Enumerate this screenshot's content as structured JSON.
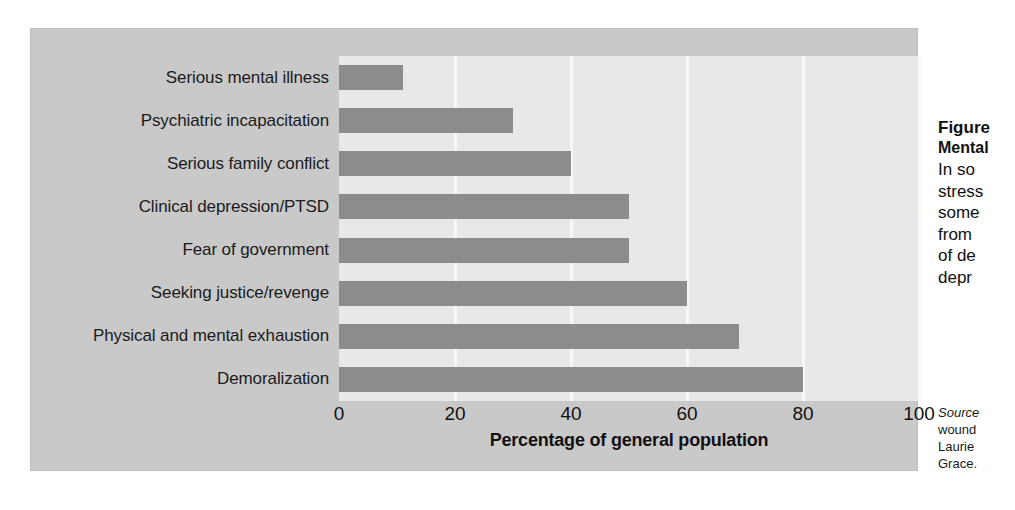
{
  "figure": {
    "caption_title": "Figure",
    "caption_subtitle": "Mental",
    "caption_lines": [
      "In so",
      "stress",
      "some",
      "from",
      "of de",
      "depr"
    ],
    "source_lines": [
      "Source",
      "wound",
      "Laurie",
      "Grace."
    ]
  },
  "chart_data": {
    "type": "bar",
    "orientation": "horizontal",
    "title": "",
    "xlabel": "Percentage of general population",
    "ylabel": "",
    "xlim": [
      0,
      100
    ],
    "xticks": [
      0,
      20,
      40,
      60,
      80,
      100
    ],
    "grid": true,
    "legend": "none",
    "bar_color": "#8c8c8c",
    "plot_background": "#e8e8e6",
    "figure_background": "#c9c9c9",
    "categories": [
      "Serious mental illness",
      "Psychiatric incapacitation",
      "Serious family conflict",
      "Clinical depression/PTSD",
      "Fear of government",
      "Seeking justice/revenge",
      "Physical and mental exhaustion",
      "Demoralization"
    ],
    "values": [
      11,
      30,
      40,
      50,
      50,
      60,
      69,
      80
    ]
  }
}
